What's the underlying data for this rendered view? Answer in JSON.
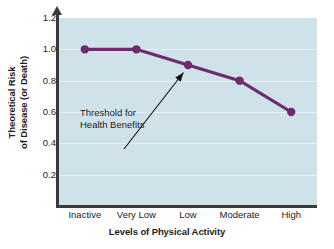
{
  "chart_data": {
    "type": "line",
    "title": "",
    "subtitle": "",
    "xlabel": "Levels of Physical Activity",
    "ylabel_line1": "Theoretical Risk",
    "ylabel_line2": "of Disease (or Death)",
    "categories": [
      "Inactive",
      "Very Low",
      "Low",
      "Moderate",
      "High"
    ],
    "values": [
      1.0,
      1.0,
      0.9,
      0.8,
      0.6
    ],
    "series": [
      {
        "name": "Theoretical Risk of Disease (or Death)",
        "values": [
          1.0,
          1.0,
          0.9,
          0.8,
          0.6
        ]
      }
    ],
    "ylim": [
      0.0,
      1.2
    ],
    "yticks": [
      "1.2",
      "1.0",
      "0.8",
      "0.6",
      "0.4",
      "0.2"
    ],
    "ytick_values": [
      1.2,
      1.0,
      0.8,
      0.6,
      0.4,
      0.2
    ],
    "grid": true,
    "grid_orientation": "horizontal",
    "legend": "none",
    "annotations": [
      {
        "name": "threshold-annotation",
        "line1": "Threshold for",
        "line2": "Health Benefits",
        "points_to_category": "Low",
        "points_to_value": 0.9
      }
    ],
    "colors": {
      "line": "#6f2b6e",
      "marker": "#6f2b6e",
      "plot_background": "#cfe1e9",
      "gridline": "#e8f2f6",
      "axis": "#3a3a3a",
      "text": "#1d1d1d",
      "figure_background": "#ffffff",
      "annotation_arrow": "#111111"
    }
  }
}
